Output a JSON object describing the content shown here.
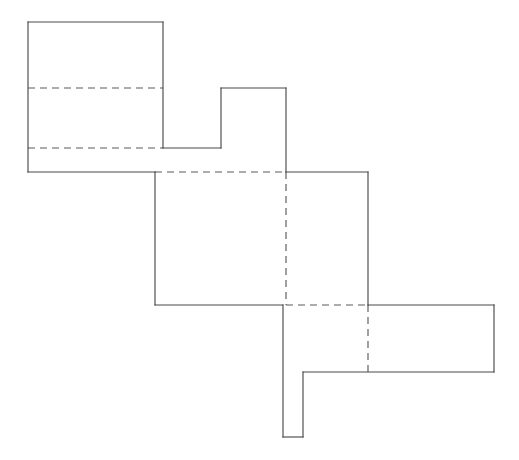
{
  "figure": {
    "background_color": "#ffffff",
    "solid_line_color": "#4a4a4a",
    "dashed_line_color": "#5a5a5a",
    "stroke_width": 1.15,
    "dash_pattern": "7 5",
    "canvas": {
      "width": 519,
      "height": 460
    },
    "outline_name": "stepped-staircase-outline",
    "outline_points": "28,22 163,22 163,172 221,172 221,88 286,88 286,172 368,172 368,305 494,305 494,372 303,372 303,437 283,437 283,305 155,305 155,172 28,172",
    "hidden_edges": [
      {
        "name": "upper-horizontal-dashed",
        "x1": 28,
        "y1": 88,
        "x2": 163,
        "y2": 88
      },
      {
        "name": "lower-horizontal-dashed",
        "x1": 28,
        "y1": 148,
        "x2": 163,
        "y2": 148
      },
      {
        "name": "middle-top-horizontal-dashed",
        "x1": 155,
        "y1": 172,
        "x2": 286,
        "y2": 172
      },
      {
        "name": "middle-bottom-horizontal-dashed",
        "x1": 286,
        "y1": 305,
        "x2": 368,
        "y2": 305
      },
      {
        "name": "center-vertical-dashed",
        "x1": 286,
        "y1": 172,
        "x2": 286,
        "y2": 305
      },
      {
        "name": "right-vertical-dashed",
        "x1": 368,
        "y1": 305,
        "x2": 368,
        "y2": 372
      }
    ],
    "visible_edges": [
      {
        "name": "top-left-square-top",
        "x1": 28,
        "y1": 22,
        "x2": 163,
        "y2": 22
      },
      {
        "name": "top-left-square-left",
        "x1": 28,
        "y1": 22,
        "x2": 28,
        "y2": 172
      },
      {
        "name": "top-left-square-bottom",
        "x1": 28,
        "y1": 172,
        "x2": 155,
        "y2": 172
      },
      {
        "name": "top-left-square-right",
        "x1": 163,
        "y1": 22,
        "x2": 163,
        "y2": 148
      },
      {
        "name": "notch-bottom-left",
        "x1": 163,
        "y1": 148,
        "x2": 221,
        "y2": 148
      },
      {
        "name": "tab-left",
        "x1": 221,
        "y1": 148,
        "x2": 221,
        "y2": 88
      },
      {
        "name": "tab-top",
        "x1": 221,
        "y1": 88,
        "x2": 286,
        "y2": 88
      },
      {
        "name": "tab-right",
        "x1": 286,
        "y1": 88,
        "x2": 286,
        "y2": 172
      },
      {
        "name": "upper-right-shelf-top",
        "x1": 286,
        "y1": 172,
        "x2": 368,
        "y2": 172
      },
      {
        "name": "middle-square-left",
        "x1": 155,
        "y1": 172,
        "x2": 155,
        "y2": 305
      },
      {
        "name": "middle-square-bottom",
        "x1": 155,
        "y1": 305,
        "x2": 283,
        "y2": 305
      },
      {
        "name": "middle-right-vertical",
        "x1": 368,
        "y1": 172,
        "x2": 368,
        "y2": 305
      },
      {
        "name": "right-wing-top",
        "x1": 368,
        "y1": 305,
        "x2": 494,
        "y2": 305
      },
      {
        "name": "right-wing-right",
        "x1": 494,
        "y1": 305,
        "x2": 494,
        "y2": 372
      },
      {
        "name": "right-wing-bottom",
        "x1": 303,
        "y1": 372,
        "x2": 494,
        "y2": 372
      },
      {
        "name": "stub-right",
        "x1": 303,
        "y1": 372,
        "x2": 303,
        "y2": 437
      },
      {
        "name": "stub-bottom",
        "x1": 283,
        "y1": 437,
        "x2": 303,
        "y2": 437
      },
      {
        "name": "stub-left",
        "x1": 283,
        "y1": 305,
        "x2": 283,
        "y2": 437
      }
    ]
  }
}
